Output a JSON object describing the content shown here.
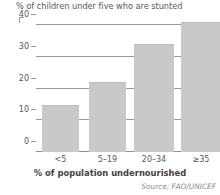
{
  "chart_data": {
    "type": "bar",
    "title": "% of children under five who are stunted",
    "xlabel": "% of population undernourished",
    "ylabel": "",
    "categories": [
      "<5",
      "5–19",
      "20–34",
      "≥35"
    ],
    "values": [
      15,
      22,
      34,
      41
    ],
    "yticks": [
      0,
      10,
      20,
      30,
      40
    ],
    "ytick_labels": [
      "0",
      "10",
      "20",
      "30",
      "40"
    ],
    "ylim": [
      0,
      42
    ],
    "grid": true,
    "legend": false,
    "series": [
      {
        "name": "% of children under five who are stunted",
        "values": [
          15,
          22,
          34,
          41
        ]
      }
    ],
    "annotations": {
      "source": "Source: FAO/UNICEF"
    },
    "colors": {
      "bar_fill": "#c9c9c9",
      "bar_edge": "#bcbcbc",
      "gridline": "#9a9a9a",
      "text": "#55595c",
      "axis_label_text": "#3f4244",
      "source_text": "#8a8d8f",
      "background": "#ffffff"
    }
  }
}
